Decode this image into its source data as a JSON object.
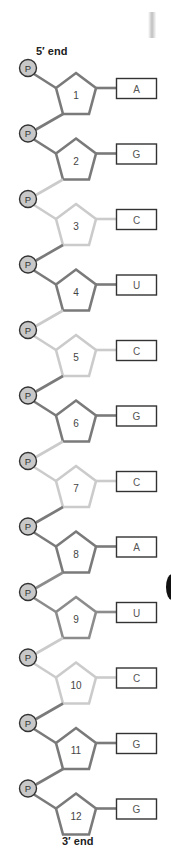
{
  "diagram": {
    "five_prime_label": "5′ end",
    "three_prime_label": "3′ end",
    "phosphate_label": "P",
    "colors": {
      "dark": "#7a7a7a",
      "medium": "#8c8c8c",
      "light": "#cbcbcb",
      "phosphate_fill": "#c8c8c8",
      "phosphate_stroke": "#333333",
      "box_stroke": "#333333"
    },
    "nucleotides": [
      {
        "number": "1",
        "base": "A",
        "shade": "dark"
      },
      {
        "number": "2",
        "base": "G",
        "shade": "dark"
      },
      {
        "number": "3",
        "base": "C",
        "shade": "light"
      },
      {
        "number": "4",
        "base": "U",
        "shade": "dark"
      },
      {
        "number": "5",
        "base": "C",
        "shade": "light"
      },
      {
        "number": "6",
        "base": "G",
        "shade": "dark"
      },
      {
        "number": "7",
        "base": "C",
        "shade": "light"
      },
      {
        "number": "8",
        "base": "A",
        "shade": "dark"
      },
      {
        "number": "9",
        "base": "U",
        "shade": "medium"
      },
      {
        "number": "10",
        "base": "C",
        "shade": "light"
      },
      {
        "number": "11",
        "base": "G",
        "shade": "dark"
      },
      {
        "number": "12",
        "base": "G",
        "shade": "dark"
      }
    ]
  }
}
